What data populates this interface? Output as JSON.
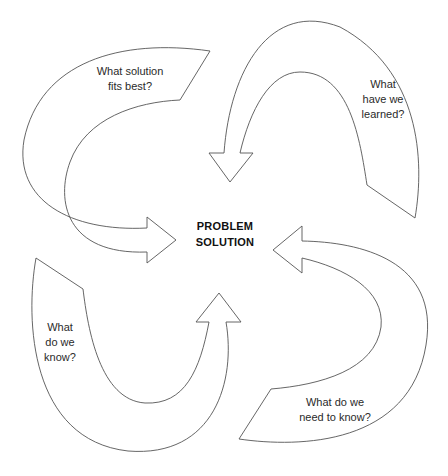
{
  "diagram": {
    "type": "cycle",
    "center": {
      "lines": [
        "PROBLEM",
        "SOLUTION"
      ]
    },
    "arrows": [
      {
        "id": "upper-left",
        "lines": [
          "What solution",
          "fits best?"
        ],
        "points_to": "center-left"
      },
      {
        "id": "upper-right",
        "lines": [
          "What",
          "have we",
          "learned?"
        ],
        "points_to": "center-top"
      },
      {
        "id": "lower-right",
        "lines": [
          "What do we",
          "need to know?"
        ],
        "points_to": "center-right"
      },
      {
        "id": "lower-left",
        "lines": [
          "What",
          "do we",
          "know?"
        ],
        "points_to": "center-bottom"
      }
    ],
    "colors": {
      "stroke": "#555555",
      "fill": "#ffffff",
      "text": "#2a2a2a",
      "center_text": "#111111"
    }
  }
}
